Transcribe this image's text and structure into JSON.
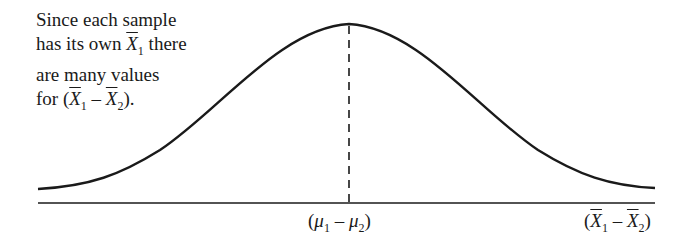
{
  "annotation": {
    "line1": "Since each sample",
    "line2_pre": "has its own ",
    "line2_var": "X",
    "line2_sub": "1",
    "line2_post": " there",
    "line3": "are many values",
    "line4_pre": "for (",
    "line4_var1": "X",
    "line4_sub1": "1",
    "line4_op": " – ",
    "line4_var2": "X",
    "line4_sub2": "2",
    "line4_post": ")."
  },
  "center_label": {
    "open": "(",
    "var1": "μ",
    "sub1": "1",
    "op": " – ",
    "var2": "μ",
    "sub2": "2",
    "close": ")"
  },
  "axis_label": {
    "open": "(",
    "var1": "X",
    "sub1": "1",
    "op": " – ",
    "var2": "X",
    "sub2": "2",
    "close": ")"
  },
  "colors": {
    "stroke": "#1a1a1a",
    "background": "#ffffff"
  }
}
